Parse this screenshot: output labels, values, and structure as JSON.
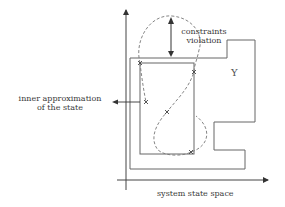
{
  "diagram": {
    "type": "state-space constraint diagram",
    "labels": {
      "constraints_line1": "constraints",
      "constraints_line2": "violation",
      "inner_line1": "inner approximation",
      "inner_line2": "of the state",
      "region_symbol": "Υ",
      "x_axis": "system state space"
    },
    "colors": {
      "stroke": "#555555",
      "dashed_curve": "#777777",
      "text": "#3a3a3a",
      "background": "#ffffff"
    },
    "markers": [
      {
        "name": "cross-1",
        "x": 140,
        "y": 63
      },
      {
        "name": "cross-2",
        "x": 194,
        "y": 72
      },
      {
        "name": "cross-3",
        "x": 146,
        "y": 102
      },
      {
        "name": "cross-4",
        "x": 167,
        "y": 112
      },
      {
        "name": "cross-5",
        "x": 191,
        "y": 152
      }
    ]
  }
}
